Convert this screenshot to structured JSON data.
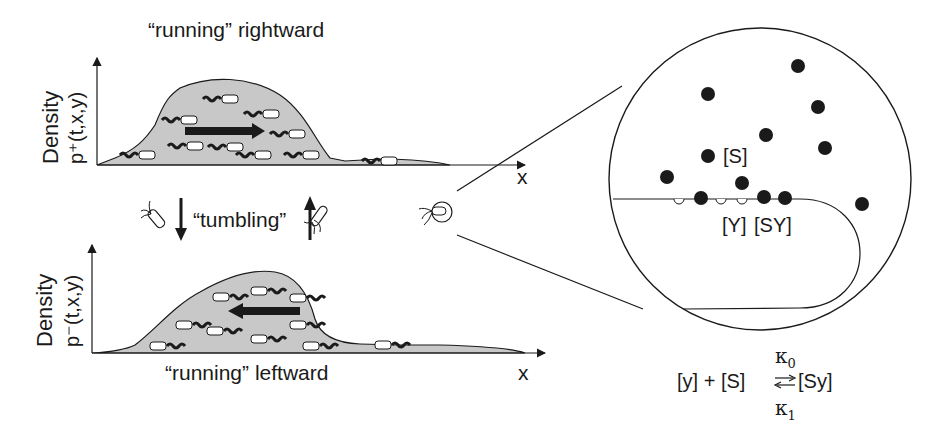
{
  "top_panel": {
    "title": "“running” rightward",
    "ylabel_line1": "Density",
    "ylabel_line2": "p⁺(t,x,y)",
    "xlabel": "x",
    "arrow_direction": "right"
  },
  "middle": {
    "tumbling_label": "“tumbling”",
    "icons": [
      "bacterium-down-icon",
      "arrow-down-icon",
      "arrow-up-icon",
      "bacterium-up-icon",
      "bacterium-zoom-icon"
    ]
  },
  "bottom_panel": {
    "title": "“running” leftward",
    "ylabel_line1": "Density",
    "ylabel_line2": "p⁻(t,x,y)",
    "xlabel": "x",
    "arrow_direction": "left"
  },
  "zoom_circle": {
    "ligand_label": "[S]",
    "receptor_label": "[Y]",
    "complex_label": "[SY]"
  },
  "reaction": {
    "lhs": "[y] + [S]",
    "rhs": "[Sy]",
    "forward_rate": "κ",
    "forward_sub": "0",
    "reverse_rate": "κ",
    "reverse_sub": "1"
  },
  "colors": {
    "fill": "#c8c8c8",
    "ink": "#1a1a1a",
    "background": "#ffffff"
  }
}
